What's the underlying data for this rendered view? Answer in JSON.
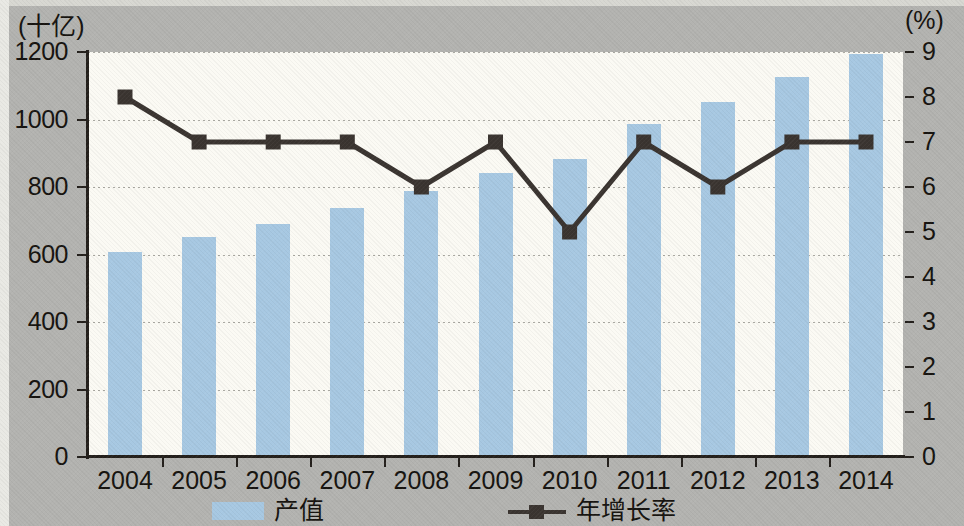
{
  "chart_data": {
    "type": "bar",
    "title": "",
    "subtitle": "",
    "xlabel": "",
    "categories": [
      "2004",
      "2005",
      "2006",
      "2007",
      "2008",
      "2009",
      "2010",
      "2011",
      "2012",
      "2013",
      "2014"
    ],
    "left_axis": {
      "unit_label": "(十亿)",
      "ylabel": "",
      "ylim": [
        0,
        1200
      ],
      "ticks": [
        0,
        200,
        400,
        600,
        800,
        1000,
        1200
      ],
      "tick_labels": [
        "0",
        "200",
        "400",
        "600",
        "800",
        "1000",
        "1200"
      ]
    },
    "right_axis": {
      "unit_label": "(%)",
      "ylabel": "",
      "ylim": [
        0,
        9
      ],
      "ticks": [
        0,
        1,
        2,
        3,
        4,
        5,
        6,
        7,
        8,
        9
      ],
      "tick_labels": [
        "0",
        "1",
        "2",
        "3",
        "4",
        "5",
        "6",
        "7",
        "8",
        "9"
      ]
    },
    "grid": true,
    "legend_position": "bottom",
    "series": [
      {
        "name": "产值",
        "type": "bar",
        "axis": "left",
        "color": "#a7c8e2",
        "values": [
          607,
          652,
          690,
          737,
          788,
          841,
          883,
          987,
          1052,
          1126,
          1195
        ]
      },
      {
        "name": "年增长率",
        "type": "line",
        "axis": "right",
        "color": "#3a3430",
        "marker": "square",
        "values": [
          8.0,
          7.0,
          7.0,
          7.0,
          6.0,
          7.0,
          5.0,
          7.0,
          6.0,
          7.0,
          7.0
        ]
      }
    ],
    "colors": {
      "bar": "#a7c8e2",
      "line": "#3a3430",
      "plot_background": "#fbfaf4",
      "page_background": "#b3b3b0",
      "axis": "#231f1b",
      "gridline": "#9a9a92"
    }
  },
  "legend": {
    "items": [
      {
        "label": "产值",
        "marker": "bar-swatch"
      },
      {
        "label": "年增长率",
        "marker": "line-square-marker"
      }
    ]
  }
}
